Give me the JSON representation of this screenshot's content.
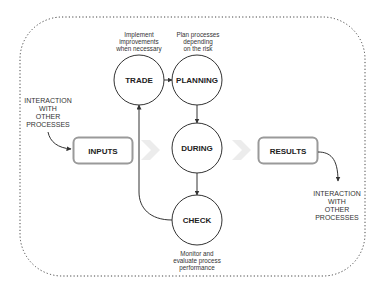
{
  "diagram": {
    "nodes": {
      "trade": {
        "label": "TRADE",
        "note": [
          "Implement",
          "improvements",
          "when necessary"
        ]
      },
      "planning": {
        "label": "PLANNING",
        "note": [
          "Plan processes",
          "depending",
          "on the risk"
        ]
      },
      "during": {
        "label": "DURING"
      },
      "check": {
        "label": "CHECK",
        "note": [
          "Monitor and",
          "evaluate process",
          "performance"
        ]
      }
    },
    "inputs": {
      "label": "INPUTS"
    },
    "results": {
      "label": "RESULTS"
    },
    "left_interaction": {
      "lines": [
        "INTERACTION",
        "WITH",
        "OTHER",
        "PROCESSES"
      ]
    },
    "right_interaction": {
      "lines": [
        "INTERACTION",
        "WITH",
        "OTHER",
        "PROCESSES"
      ]
    },
    "colors": {
      "stroke": "#333333",
      "box_border": "#9a9a9a",
      "chevron": "#ececec",
      "frame": "#444444"
    }
  }
}
